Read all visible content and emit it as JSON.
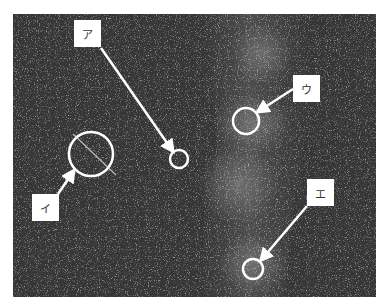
{
  "figure": {
    "background_color": "#3a3a3a",
    "marker_color": "#ffffff"
  },
  "labels": [
    {
      "id": "a",
      "text": "ア",
      "box": [
        74,
        20
      ],
      "circle": {
        "cx": 179,
        "cy": 159,
        "r": 9
      },
      "arrow": {
        "from": [
          101,
          48
        ],
        "to": [
          172,
          150
        ]
      }
    },
    {
      "id": "i",
      "text": "イ",
      "box": [
        32,
        194
      ],
      "circle": {
        "cx": 91,
        "cy": 154,
        "r": 22
      },
      "arrow": {
        "from": [
          58,
          194
        ],
        "to": [
          73,
          172
        ]
      }
    },
    {
      "id": "u",
      "text": "ウ",
      "box": [
        293,
        75
      ],
      "circle": {
        "cx": 246,
        "cy": 121,
        "r": 13
      },
      "arrow": {
        "from": [
          293,
          89
        ],
        "to": [
          259,
          111
        ]
      }
    },
    {
      "id": "e",
      "text": "エ",
      "box": [
        307,
        179
      ],
      "circle": {
        "cx": 253,
        "cy": 269,
        "r": 10
      },
      "arrow": {
        "from": [
          307,
          206
        ],
        "to": [
          262,
          259
        ]
      }
    }
  ]
}
